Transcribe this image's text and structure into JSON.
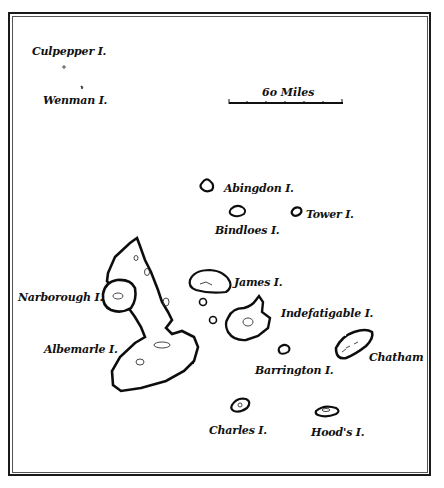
{
  "map": {
    "scale": {
      "label": "6o Miles"
    },
    "islands": [
      {
        "id": "culpepper",
        "label": "Culpepper I."
      },
      {
        "id": "wenman",
        "label": "Wenman I."
      },
      {
        "id": "abingdon",
        "label": "Abingdon I."
      },
      {
        "id": "bindloes",
        "label": "Bindloes I."
      },
      {
        "id": "tower",
        "label": "Tower I."
      },
      {
        "id": "narborough",
        "label": "Narborough I."
      },
      {
        "id": "james",
        "label": "James I."
      },
      {
        "id": "indefatigable",
        "label": "Indefatigable I."
      },
      {
        "id": "albemarle",
        "label": "Albemarle I."
      },
      {
        "id": "barrington",
        "label": "Barrington I."
      },
      {
        "id": "chatham",
        "label": "Chatham"
      },
      {
        "id": "charles",
        "label": "Charles I."
      },
      {
        "id": "hoods",
        "label": "Hood's I."
      }
    ],
    "colors": {
      "ink": "#111111",
      "paper": "#ffffff",
      "shading": "#555555"
    }
  }
}
